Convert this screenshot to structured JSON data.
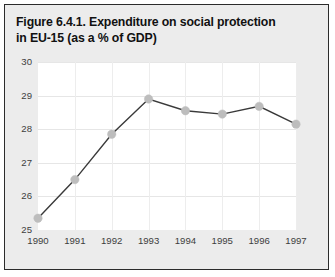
{
  "figure": {
    "title_line1": "Figure 6.4.1. Expenditure on social protection",
    "title_line2": "in EU-15 (as a % of GDP)",
    "frame_color": "#2b2b2b",
    "background_color": "#ececec",
    "plot_background_color": "#ffffff"
  },
  "chart_data": {
    "type": "line",
    "title": "Figure 6.4.1. Expenditure on social protection in EU-15 (as a % of GDP)",
    "xlabel": "",
    "ylabel": "",
    "categories": [
      "1990",
      "1991",
      "1992",
      "1993",
      "1994",
      "1995",
      "1996",
      "1997"
    ],
    "values": [
      25.35,
      26.5,
      27.85,
      28.9,
      28.55,
      28.45,
      28.68,
      28.15
    ],
    "series": [
      {
        "name": "EU-15 expenditure on social protection (% of GDP)",
        "values": [
          25.35,
          26.5,
          27.85,
          28.9,
          28.55,
          28.45,
          28.68,
          28.15
        ],
        "line_color": "#3a3a3a",
        "marker_color": "#bdbdbd"
      }
    ],
    "ylim": [
      25,
      30
    ],
    "yticks": [
      25,
      26,
      27,
      28,
      29,
      30
    ],
    "ytick_labels": [
      "25",
      "26",
      "27",
      "28",
      "29",
      "30"
    ],
    "xtick_labels": [
      "1990",
      "1991",
      "1992",
      "1993",
      "1994",
      "1995",
      "1996",
      "1997"
    ],
    "grid": true,
    "grid_color": "#e6e6e6",
    "legend": false,
    "legend_position": "none"
  }
}
